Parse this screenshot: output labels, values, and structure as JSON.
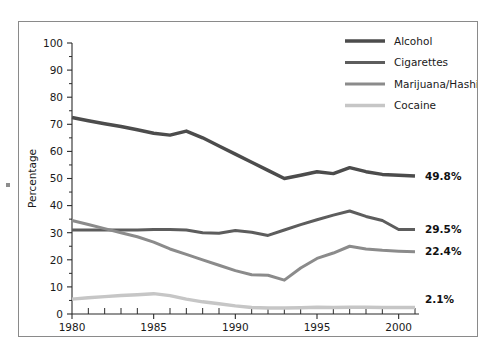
{
  "chart_data": {
    "type": "line",
    "title": "",
    "subtitle": "",
    "xlabel": "",
    "ylabel": "Percentage",
    "xlim": [
      1980,
      2001
    ],
    "ylim": [
      0,
      100
    ],
    "grid": false,
    "legend_position": "top-right",
    "x": [
      1980,
      1981,
      1982,
      1983,
      1984,
      1985,
      1986,
      1987,
      1988,
      1989,
      1990,
      1991,
      1992,
      1993,
      1994,
      1995,
      1996,
      1997,
      1998,
      1999,
      2000,
      2001
    ],
    "y_ticks": [
      0,
      10,
      20,
      30,
      40,
      50,
      60,
      70,
      80,
      90,
      100
    ],
    "y_tick_labels": [
      "0",
      "10",
      "20",
      "30",
      "40",
      "50",
      "60",
      "70",
      "80",
      "90",
      "100"
    ],
    "y_minor_step": 5,
    "x_ticks": [
      1980,
      1985,
      1990,
      1995,
      2000
    ],
    "x_tick_labels": [
      "1980",
      "1985",
      "1990",
      "1995",
      "2000"
    ],
    "x_minor_step": 1,
    "series": [
      {
        "name": "Alcohol",
        "color": "#4c4c4c",
        "end_label": "49.8%",
        "values": [
          72.5,
          71.3,
          70.2,
          69.2,
          68.0,
          66.7,
          66.0,
          67.5,
          65.0,
          62.0,
          59.0,
          56.0,
          53.0,
          50.0,
          51.2,
          52.5,
          51.8,
          54.0,
          52.5,
          51.5,
          51.2,
          50.9
        ]
      },
      {
        "name": "Cigarettes",
        "color": "#5d5d5d",
        "end_label": "29.5%",
        "values": [
          31.0,
          31.0,
          31.0,
          31.0,
          31.0,
          31.2,
          31.2,
          31.0,
          30.0,
          29.8,
          30.8,
          30.2,
          29.0,
          31.0,
          33.0,
          34.8,
          36.5,
          38.0,
          36.0,
          34.5,
          31.2,
          31.2
        ]
      },
      {
        "name": "Marijuana/Hashish",
        "color": "#8b8b8b",
        "end_label": "22.4%",
        "values": [
          34.5,
          33.0,
          31.5,
          30.0,
          28.5,
          26.5,
          24.0,
          22.0,
          20.0,
          18.0,
          16.0,
          14.5,
          14.3,
          12.5,
          17.0,
          20.5,
          22.5,
          25.0,
          24.0,
          23.5,
          23.2,
          23.0
        ]
      },
      {
        "name": "Cocaine",
        "color": "#c6c6c6",
        "end_label": "2.1%",
        "values": [
          5.5,
          6.0,
          6.4,
          6.8,
          7.1,
          7.5,
          6.8,
          5.5,
          4.5,
          3.8,
          3.0,
          2.4,
          2.2,
          2.2,
          2.3,
          2.5,
          2.4,
          2.5,
          2.5,
          2.4,
          2.4,
          2.4
        ]
      }
    ]
  },
  "legend": {
    "items": [
      {
        "label": "Alcohol"
      },
      {
        "label": "Cigarettes"
      },
      {
        "label": "Marijuana/Hashish"
      },
      {
        "label": "Cocaine"
      }
    ]
  },
  "end_labels": [
    {
      "text": "49.8%"
    },
    {
      "text": "29.5%"
    },
    {
      "text": "22.4%"
    },
    {
      "text": "2.1%"
    }
  ],
  "axes": {
    "y_title": "Percentage",
    "y_labels": [
      "100",
      "90",
      "80",
      "70",
      "60",
      "50",
      "40",
      "30",
      "20",
      "10",
      "0"
    ],
    "x_labels": [
      "1980",
      "1985",
      "1990",
      "1995",
      "2000"
    ]
  },
  "colors": {
    "alcohol": "#4c4c4c",
    "cigarettes": "#5d5d5d",
    "marijuana": "#8b8b8b",
    "cocaine": "#c6c6c6",
    "axis": "#2b2b2b",
    "frame": "#8a8a8a",
    "background": "#ffffff"
  }
}
